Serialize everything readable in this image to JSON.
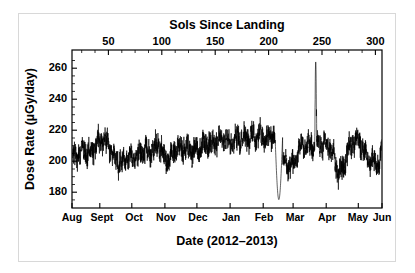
{
  "chart_data": {
    "type": "line",
    "title": "",
    "top_axis_title": "Sols Since Landing",
    "xlabel": "Date (2012–2013)",
    "ylabel": "Dose Rate (µGy/day)",
    "ylim": [
      173,
      267
    ],
    "yticks": [
      180,
      200,
      220,
      240,
      260
    ],
    "ytick_labels": [
      "180",
      "200",
      "220",
      "240",
      "260"
    ],
    "y_minor_tick_step": 5,
    "top_axis_lim": [
      15,
      305
    ],
    "top_xticks": [
      50,
      100,
      150,
      200,
      250,
      300
    ],
    "top_xtick_labels": [
      "50",
      "100",
      "150",
      "200",
      "250",
      "300"
    ],
    "bottom_xtick_labels": [
      "Aug",
      "Sept",
      "Oct",
      "Nov",
      "Dec",
      "Jan",
      "Feb",
      "Mar",
      "Apr",
      "May",
      "Jun"
    ],
    "bottom_xtick_sols": [
      15,
      41,
      71,
      102,
      132,
      163,
      194,
      222,
      253,
      283,
      314
    ],
    "grid": false,
    "legend": null,
    "line_color": "#000000",
    "axis_color": "#000000",
    "series": [
      {
        "name": "RAD surface dose rate",
        "x_units": "sols since landing",
        "y_units": "µGy/day",
        "notes": "Dense daily-averaged noisy trace; gap near sol 205-212 with a deep excursion to ~178; solar-particle-event spike to ~260 near sol 243.",
        "baseline_points": [
          [
            15,
            203
          ],
          [
            20,
            205
          ],
          [
            26,
            207
          ],
          [
            32,
            206
          ],
          [
            38,
            211
          ],
          [
            44,
            213
          ],
          [
            48,
            212
          ],
          [
            52,
            207
          ],
          [
            56,
            201
          ],
          [
            60,
            200
          ],
          [
            64,
            202
          ],
          [
            68,
            204
          ],
          [
            72,
            203
          ],
          [
            78,
            205
          ],
          [
            84,
            207
          ],
          [
            88,
            206
          ],
          [
            92,
            209
          ],
          [
            96,
            211
          ],
          [
            100,
            206
          ],
          [
            104,
            201
          ],
          [
            108,
            205
          ],
          [
            112,
            208
          ],
          [
            118,
            209
          ],
          [
            124,
            208
          ],
          [
            130,
            207
          ],
          [
            136,
            209
          ],
          [
            142,
            211
          ],
          [
            148,
            212
          ],
          [
            154,
            213
          ],
          [
            160,
            214
          ],
          [
            166,
            213
          ],
          [
            172,
            215
          ],
          [
            178,
            216
          ],
          [
            184,
            215
          ],
          [
            190,
            216
          ],
          [
            196,
            215
          ],
          [
            200,
            215
          ],
          [
            204,
            216
          ],
          [
            206,
            214
          ],
          [
            208,
            196
          ],
          [
            210,
            178
          ],
          [
            211,
            198
          ],
          [
            214,
            201
          ],
          [
            218,
            197
          ],
          [
            222,
            198
          ],
          [
            226,
            205
          ],
          [
            230,
            210
          ],
          [
            234,
            209
          ],
          [
            238,
            210
          ],
          [
            242,
            211
          ],
          [
            243,
            260
          ],
          [
            244,
            212
          ],
          [
            248,
            211
          ],
          [
            252,
            210
          ],
          [
            256,
            209
          ],
          [
            260,
            204
          ],
          [
            263,
            196
          ],
          [
            266,
            193
          ],
          [
            270,
            200
          ],
          [
            274,
            208
          ],
          [
            278,
            213
          ],
          [
            282,
            214
          ],
          [
            286,
            210
          ],
          [
            290,
            204
          ],
          [
            294,
            201
          ],
          [
            298,
            200
          ],
          [
            302,
            199
          ],
          [
            305,
            207
          ]
        ],
        "noise_amplitude": 7,
        "spike": {
          "sol": 243,
          "value": 260,
          "label": "solar particle event"
        },
        "gap": {
          "start_sol": 205,
          "end_sol": 212,
          "min_value": 178
        },
        "typical_min": 188,
        "typical_max": 224
      }
    ]
  },
  "figure": {
    "top_axis_title": "Sols Since Landing",
    "xlabel": "Date (2012–2013)",
    "ylabel": "Dose Rate (µGy/day)"
  }
}
